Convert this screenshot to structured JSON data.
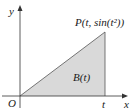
{
  "diagram": {
    "axes": {
      "x_label": "x",
      "y_label": "y",
      "origin_label": "O"
    },
    "point": {
      "label": "P(t, sin(t²))"
    },
    "region": {
      "label": "B(t)",
      "fill": "#d9d9d9"
    },
    "t_label": "t",
    "colors": {
      "axis": "#333333",
      "edge": "#555555",
      "fill": "#d9d9d9"
    }
  }
}
